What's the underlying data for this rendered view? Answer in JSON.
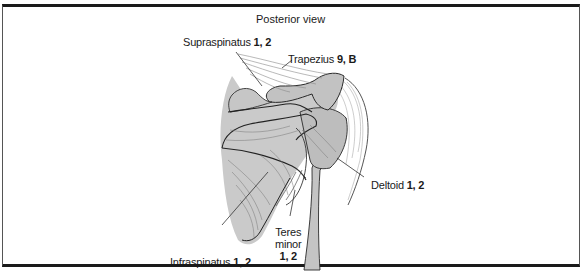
{
  "figure": {
    "title": "Posterior view",
    "labels": {
      "supraspinatus": {
        "name": "Supraspinatus",
        "refs": "1, 2"
      },
      "trapezius": {
        "name": "Trapezius",
        "refs": "9, B"
      },
      "deltoid": {
        "name": "Deltoid",
        "refs": "1, 2"
      },
      "infraspinatus": {
        "name": "Infraspinatus",
        "refs": "1, 2"
      },
      "teres_minor": {
        "name_line1": "Teres",
        "name_line2": "minor",
        "refs": "1, 2"
      }
    },
    "colors": {
      "bone_shading": "#c9c9c9",
      "outline": "#2a2a2a",
      "border": "#1a1a1a"
    }
  }
}
